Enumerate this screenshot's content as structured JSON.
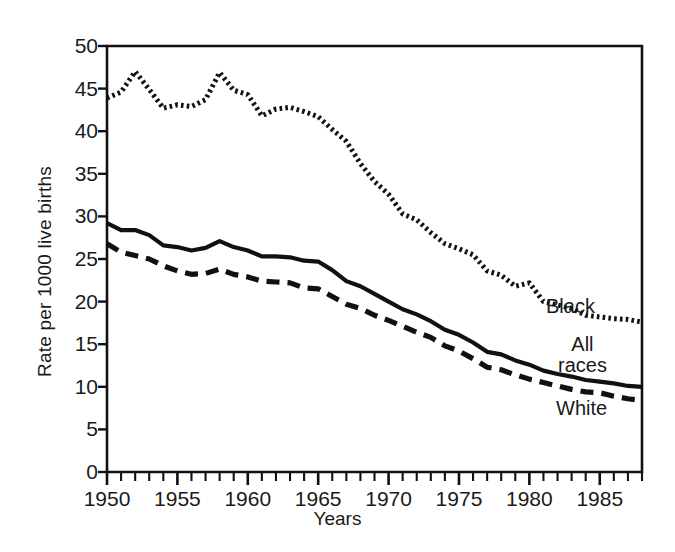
{
  "chart_data": {
    "type": "line",
    "title": "",
    "xlabel": "Years",
    "ylabel": "Rate per 1000 live births",
    "xlim": [
      1950,
      1988
    ],
    "ylim": [
      0,
      50
    ],
    "grid": false,
    "legend_position": "inline-right",
    "y_ticks": [
      0,
      5,
      10,
      15,
      20,
      25,
      30,
      35,
      40,
      45,
      50
    ],
    "y_tick_labels": [
      "0",
      "5",
      "10",
      "15",
      "20",
      "25",
      "30",
      "35",
      "40",
      "45",
      "50"
    ],
    "x_ticks": [
      1950,
      1955,
      1960,
      1965,
      1970,
      1975,
      1980,
      1985
    ],
    "x_tick_labels": [
      "1950",
      "1955",
      "1960",
      "1965",
      "1970",
      "1975",
      "1980",
      "1985"
    ],
    "x_minor_tick_interval": 1,
    "x": [
      1950,
      1951,
      1952,
      1953,
      1954,
      1955,
      1956,
      1957,
      1958,
      1959,
      1960,
      1961,
      1962,
      1963,
      1964,
      1965,
      1966,
      1967,
      1968,
      1969,
      1970,
      1971,
      1972,
      1973,
      1974,
      1975,
      1976,
      1977,
      1978,
      1979,
      1980,
      1981,
      1982,
      1983,
      1984,
      1985,
      1986,
      1987,
      1988
    ],
    "series": [
      {
        "name": "Black",
        "style": "dotted",
        "color": "#111111",
        "values": [
          43.9,
          44.6,
          47.0,
          44.9,
          42.7,
          43.1,
          42.9,
          43.7,
          46.9,
          44.8,
          44.3,
          41.8,
          42.6,
          42.8,
          42.3,
          41.7,
          40.2,
          38.8,
          36.2,
          34.1,
          32.6,
          30.3,
          29.6,
          28.1,
          26.8,
          26.2,
          25.5,
          23.6,
          23.1,
          21.8,
          22.2,
          20.0,
          19.6,
          19.2,
          18.4,
          18.2,
          18.0,
          17.9,
          17.6
        ]
      },
      {
        "name": "All races",
        "style": "solid",
        "color": "#111111",
        "values": [
          29.2,
          28.4,
          28.4,
          27.8,
          26.6,
          26.4,
          26.0,
          26.3,
          27.1,
          26.4,
          26.0,
          25.3,
          25.3,
          25.2,
          24.8,
          24.7,
          23.7,
          22.4,
          21.8,
          20.9,
          20.0,
          19.1,
          18.5,
          17.7,
          16.7,
          16.1,
          15.2,
          14.1,
          13.8,
          13.1,
          12.6,
          11.9,
          11.5,
          11.2,
          10.8,
          10.6,
          10.4,
          10.1,
          10.0
        ]
      },
      {
        "name": "White",
        "style": "dashed",
        "color": "#111111",
        "values": [
          26.8,
          25.8,
          25.4,
          25.0,
          24.2,
          23.6,
          23.2,
          23.3,
          23.8,
          23.2,
          22.9,
          22.4,
          22.3,
          22.2,
          21.6,
          21.5,
          20.6,
          19.7,
          19.2,
          18.4,
          17.8,
          17.1,
          16.4,
          15.8,
          14.8,
          14.2,
          13.3,
          12.3,
          12.0,
          11.4,
          10.9,
          10.5,
          10.1,
          9.7,
          9.4,
          9.3,
          8.9,
          8.6,
          8.4
        ]
      }
    ]
  },
  "plot_box": {
    "left": 107,
    "top": 46,
    "right": 642,
    "bottom": 472
  }
}
